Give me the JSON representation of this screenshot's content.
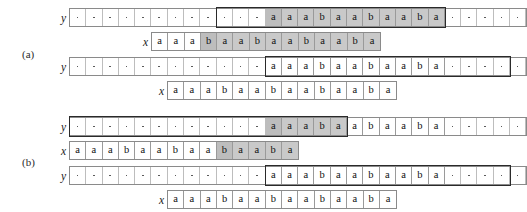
{
  "figure": {
    "symbols": {
      "y_label": "y",
      "x_label": "x"
    },
    "dot_glyph": ".",
    "colors": {
      "shade": "#c9c9c9",
      "shade_dark": "#bdbdbd",
      "cell_border": "#9a9a9a",
      "strip_border": "#8a8a8a",
      "highlight_border": "#2a2a2a",
      "text": "#111111",
      "dot": "#5a5a5a"
    },
    "groups": [
      {
        "label": "(a)",
        "rows": [
          {
            "var": "y",
            "cells": [
              ".",
              ".",
              ".",
              ".",
              ".",
              ".",
              ".",
              ".",
              ".",
              ".",
              ".",
              ".",
              "a",
              "a",
              "a",
              "b",
              "a",
              "a",
              "b",
              "a",
              "a",
              "b",
              "a",
              ".",
              ".",
              ".",
              ".",
              "."
            ],
            "shaded_from": 12,
            "shaded_to": 22,
            "highlight_from": 9,
            "highlight_to": 22
          },
          {
            "var": "x",
            "cells": [
              "a",
              "a",
              "a",
              "b",
              "a",
              "a",
              "b",
              "a",
              "a",
              "b",
              "a",
              "a",
              "b",
              "a"
            ],
            "shaded_from": 3,
            "shaded_to": 13,
            "highlight_from": -1,
            "highlight_to": -1
          },
          {
            "var": "y",
            "cells": [
              ".",
              ".",
              ".",
              ".",
              ".",
              ".",
              ".",
              ".",
              ".",
              ".",
              ".",
              ".",
              "a",
              "a",
              "a",
              "b",
              "a",
              "a",
              "b",
              "a",
              "a",
              "b",
              "a",
              ".",
              ".",
              ".",
              ".",
              "."
            ],
            "shaded_from": -1,
            "shaded_to": -1,
            "highlight_from": 12,
            "highlight_to": 26
          },
          {
            "var": "x",
            "cells": [
              "a",
              "a",
              "a",
              "b",
              "a",
              "a",
              "b",
              "a",
              "a",
              "b",
              "a",
              "a",
              "b",
              "a"
            ],
            "shaded_from": -1,
            "shaded_to": -1,
            "highlight_from": -1,
            "highlight_to": -1
          }
        ]
      },
      {
        "label": "(b)",
        "rows": [
          {
            "var": "y",
            "cells": [
              ".",
              ".",
              ".",
              ".",
              ".",
              ".",
              ".",
              ".",
              ".",
              ".",
              ".",
              ".",
              "a",
              "a",
              "a",
              "b",
              "a",
              "a",
              "b",
              "a",
              "a",
              "b",
              "a",
              ".",
              ".",
              ".",
              ".",
              "."
            ],
            "shaded_from": 12,
            "shaded_to": 16,
            "highlight_from": 0,
            "highlight_to": 16
          },
          {
            "var": "x",
            "cells": [
              "a",
              "a",
              "a",
              "b",
              "a",
              "a",
              "b",
              "a",
              "a",
              "b",
              "a",
              "a",
              "b",
              "a"
            ],
            "shaded_from": 9,
            "shaded_to": 13,
            "highlight_from": -1,
            "highlight_to": -1
          },
          {
            "var": "y",
            "cells": [
              ".",
              ".",
              ".",
              ".",
              ".",
              ".",
              ".",
              ".",
              ".",
              ".",
              ".",
              ".",
              "a",
              "a",
              "a",
              "b",
              "a",
              "a",
              "b",
              "a",
              "a",
              "b",
              "a",
              ".",
              ".",
              ".",
              ".",
              "."
            ],
            "shaded_from": -1,
            "shaded_to": -1,
            "highlight_from": 12,
            "highlight_to": 26
          },
          {
            "var": "x",
            "cells": [
              "a",
              "a",
              "a",
              "b",
              "a",
              "a",
              "b",
              "a",
              "a",
              "b",
              "a",
              "a",
              "b",
              "a"
            ],
            "shaded_from": -1,
            "shaded_to": -1,
            "highlight_from": -1,
            "highlight_to": -1
          }
        ]
      }
    ],
    "layout": {
      "cell_w": 16.3,
      "rows": [
        {
          "strip_left": 69,
          "label_left": 52,
          "top": 8
        },
        {
          "strip_left": 151,
          "label_left": 134,
          "top": 32
        },
        {
          "strip_left": 69,
          "label_left": 52,
          "top": 57
        },
        {
          "strip_left": 167,
          "label_left": 150,
          "top": 81
        },
        {
          "strip_left": 69,
          "label_left": 52,
          "top": 117
        },
        {
          "strip_left": 69,
          "label_left": 52,
          "top": 141
        },
        {
          "strip_left": 69,
          "label_left": 52,
          "top": 166
        },
        {
          "strip_left": 167,
          "label_left": 150,
          "top": 190
        }
      ],
      "group_labels": [
        {
          "left": 22,
          "top": 48
        },
        {
          "left": 22,
          "top": 156
        }
      ]
    }
  }
}
